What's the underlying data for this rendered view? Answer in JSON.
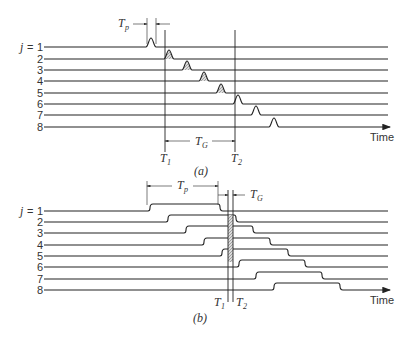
{
  "figure": {
    "panel_a": {
      "caption": "(a)",
      "row_prefix": "j = ",
      "rows": [
        "1",
        "2",
        "3",
        "4",
        "5",
        "6",
        "7",
        "8"
      ],
      "time_label": "Time",
      "labels": {
        "tp": "T",
        "tp_sub": "p",
        "tg": "T",
        "tg_sub": "G",
        "t1": "T",
        "t1_sub": "1",
        "t2": "T",
        "t2_sub": "2"
      },
      "pulse_x": [
        151,
        169,
        187,
        204,
        221,
        238,
        256,
        274
      ],
      "shaded_rows": [
        2,
        3,
        4,
        5
      ]
    },
    "panel_b": {
      "caption": "(b)",
      "row_prefix": "j = ",
      "rows": [
        "1",
        "2",
        "3",
        "4",
        "5",
        "6",
        "7",
        "8"
      ],
      "time_label": "Time",
      "labels": {
        "tp": "T",
        "tp_sub": "p",
        "tg": "T",
        "tg_sub": "G",
        "t1": "T",
        "t1_sub": "1",
        "t2": "T",
        "t2_sub": "2"
      },
      "pulse_rise_x": [
        148,
        166,
        184,
        202,
        220,
        237,
        254,
        272
      ],
      "pulse_fall_x": [
        218,
        234,
        251,
        268,
        286,
        303,
        320,
        338
      ]
    }
  }
}
